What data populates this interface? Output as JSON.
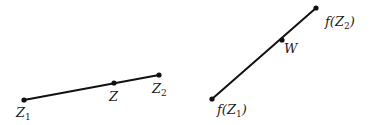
{
  "diagram": {
    "left_segment": {
      "name": "domain-segment",
      "start": {
        "label": "Z",
        "sub": "1",
        "x": 24,
        "y": 100,
        "lx": 16,
        "ly": 117
      },
      "mid": {
        "label": "Z",
        "sub": "",
        "x": 114,
        "y": 83,
        "lx": 109,
        "ly": 101
      },
      "end": {
        "label": "Z",
        "sub": "2",
        "x": 159,
        "y": 75,
        "lx": 152,
        "ly": 93
      }
    },
    "right_segment": {
      "name": "image-segment",
      "start": {
        "label": "f(Z",
        "sub": "1",
        "close": ")",
        "x": 212,
        "y": 99,
        "lx": 217,
        "ly": 114
      },
      "mid": {
        "label": "W",
        "sub": "",
        "x": 282,
        "y": 40,
        "lx": 284,
        "ly": 53
      },
      "end": {
        "label": "f(Z",
        "sub": "2",
        "close": ")",
        "x": 316,
        "y": 8,
        "lx": 325,
        "ly": 26
      }
    },
    "colors": {
      "line": "#111111",
      "text": "#1a1a1a",
      "background": "#ffffff"
    }
  }
}
